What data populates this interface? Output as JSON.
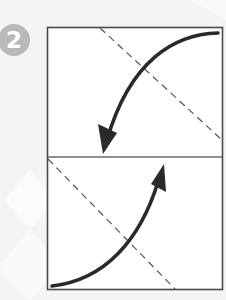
{
  "diagram": {
    "step_number": "2",
    "colors": {
      "background": "#f4f4f4",
      "background_shapes": "#fbfbfb",
      "badge": "#b9b9b9",
      "badge_text": "#ffffff",
      "paper": "#ffffff",
      "outline": "#4a4a4a",
      "fold_line": "#555555",
      "arrow": "#2a2a2a"
    },
    "elements": [
      {
        "type": "paper-rectangle",
        "x": 47,
        "y": 27,
        "width": 176,
        "height": 263
      },
      {
        "type": "crease-line",
        "orientation": "horizontal",
        "y": 157
      },
      {
        "type": "dashed-fold-line",
        "position": "upper",
        "from": [
          100,
          28
        ],
        "to": [
          223,
          140
        ]
      },
      {
        "type": "dashed-fold-line",
        "position": "lower",
        "from": [
          48,
          160
        ],
        "to": [
          175,
          290
        ]
      },
      {
        "type": "fold-arrow",
        "position": "upper",
        "direction": "down-left",
        "from": [
          218,
          35
        ],
        "to": [
          103,
          152
        ]
      },
      {
        "type": "fold-arrow",
        "position": "lower",
        "direction": "up-right",
        "from": [
          52,
          285
        ],
        "to": [
          165,
          165
        ]
      }
    ]
  }
}
